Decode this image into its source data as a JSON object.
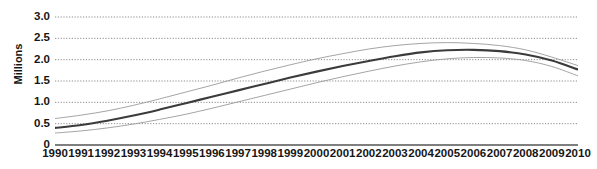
{
  "chart_data": {
    "type": "line",
    "title": "",
    "xlabel": "",
    "ylabel": "Millions",
    "x": [
      1990,
      1991,
      1992,
      1993,
      1994,
      1995,
      1996,
      1997,
      1998,
      1999,
      2000,
      2001,
      2002,
      2003,
      2004,
      2005,
      2006,
      2007,
      2008,
      2009,
      2010
    ],
    "xtick_labels": [
      "1990",
      "1991",
      "1992",
      "1993",
      "1994",
      "1995",
      "1996",
      "1997",
      "1998",
      "1999",
      "2000",
      "2001",
      "2002",
      "2003",
      "2004",
      "2005",
      "2006",
      "2007",
      "2008",
      "2009",
      "2010"
    ],
    "ytick_labels": [
      "3.0",
      "2.5",
      "2.0",
      "1.5",
      "1.0",
      "0.5",
      "0"
    ],
    "ytick_values": [
      3.0,
      2.5,
      2.0,
      1.5,
      1.0,
      0.5,
      0
    ],
    "ylim": [
      0,
      3.0
    ],
    "xlim": [
      1990,
      2010
    ],
    "grid": "horizontal-dotted",
    "legend": "none",
    "series": [
      {
        "name": "upper-bound",
        "style": "thin-gray-line",
        "color": "#9a9a9a",
        "values": [
          0.62,
          0.7,
          0.8,
          0.93,
          1.08,
          1.24,
          1.4,
          1.57,
          1.73,
          1.88,
          2.02,
          2.14,
          2.25,
          2.33,
          2.38,
          2.4,
          2.38,
          2.33,
          2.23,
          2.06,
          1.86
        ]
      },
      {
        "name": "estimate",
        "style": "thick-dark-line",
        "color": "#3b3b3b",
        "values": [
          0.4,
          0.47,
          0.57,
          0.69,
          0.83,
          0.98,
          1.13,
          1.28,
          1.43,
          1.58,
          1.72,
          1.85,
          1.97,
          2.08,
          2.17,
          2.22,
          2.23,
          2.2,
          2.12,
          1.98,
          1.77
        ]
      },
      {
        "name": "lower-bound",
        "style": "thin-gray-line",
        "color": "#9a9a9a",
        "values": [
          0.28,
          0.33,
          0.4,
          0.49,
          0.6,
          0.72,
          0.86,
          1.01,
          1.16,
          1.31,
          1.46,
          1.6,
          1.73,
          1.85,
          1.95,
          2.02,
          2.05,
          2.04,
          1.98,
          1.84,
          1.62
        ]
      }
    ]
  },
  "axes": {
    "y_title": "Millions"
  }
}
